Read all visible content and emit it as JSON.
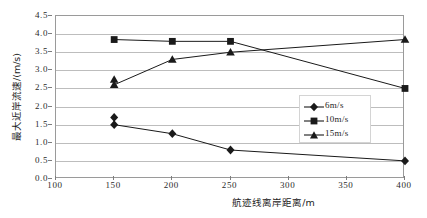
{
  "chart_data": {
    "type": "line",
    "title": "",
    "xlabel": "航迹线离岸距离/m",
    "ylabel": "最大近岸流速/(m/s)",
    "xlim": [
      100,
      400
    ],
    "ylim": [
      0.0,
      4.5
    ],
    "xticks": [
      "100",
      "150",
      "200",
      "250",
      "300",
      "350",
      "400"
    ],
    "yticks": [
      "0.0",
      "0.5",
      "1.0",
      "1.5",
      "2.0",
      "2.5",
      "3.0",
      "3.5",
      "4.0",
      "4.5"
    ],
    "grid": true,
    "legend_position": "center-right",
    "x": [
      150,
      200,
      250,
      400
    ],
    "series": [
      {
        "name": "6m/s",
        "marker": "diamond",
        "color": "#1a1a1a",
        "values": [
          1.5,
          1.25,
          0.8,
          0.5
        ],
        "extra_points": [
          {
            "x": 150,
            "y": 1.7
          }
        ]
      },
      {
        "name": "10m/s",
        "marker": "square",
        "color": "#1a1a1a",
        "values": [
          3.85,
          3.8,
          3.8,
          2.5
        ]
      },
      {
        "name": "15m/s",
        "marker": "triangle",
        "color": "#1a1a1a",
        "values": [
          2.6,
          3.3,
          3.5,
          3.85
        ],
        "extra_points": [
          {
            "x": 150,
            "y": 2.75
          }
        ]
      }
    ]
  },
  "legend": {
    "items": [
      {
        "label": "6m/s",
        "marker": "diamond"
      },
      {
        "label": "10m/s",
        "marker": "square"
      },
      {
        "label": "15m/s",
        "marker": "triangle"
      }
    ]
  },
  "axes": {
    "y_title": "最大近岸流速/(m/s)",
    "x_title": "航迹线离岸距离/m"
  }
}
